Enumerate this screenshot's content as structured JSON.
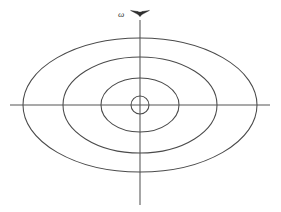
{
  "figure": {
    "background_color": "#ffffff",
    "line_color": "#4a4a4a",
    "axis_color": "#555555",
    "width": 281,
    "height": 212
  },
  "labels": {
    "omega": {
      "text": "ω",
      "name": "angular-velocity-symbol",
      "x": 118,
      "y": 10
    }
  },
  "markers": {
    "rotation_arrow": {
      "name": "rotation-axis-arrowhead",
      "description": "double arrowhead on vertical axis indicating angular velocity vector",
      "x": 140,
      "y": 13
    }
  },
  "chart_data": {
    "type": "line",
    "subtitle": "",
    "xlabel": "",
    "ylabel": "",
    "grid": false,
    "legend": "none",
    "center": {
      "x": 140,
      "y": 105
    },
    "axes": {
      "horizontal": {
        "x1": 10,
        "y1": 105,
        "x2": 270,
        "y2": 105
      },
      "vertical": {
        "x1": 140,
        "y1": 20,
        "x2": 140,
        "y2": 205
      }
    },
    "annotations": [
      {
        "text": "ω",
        "x": 118,
        "y": 10
      }
    ],
    "series": [
      {
        "name": "contour-1-inner",
        "shape": "ellipse",
        "cx": 140,
        "cy": 105,
        "rx": 9,
        "ry": 9,
        "x_intercepts": [
          131,
          149
        ],
        "y_intercepts": [
          96,
          114
        ]
      },
      {
        "name": "contour-2",
        "shape": "ellipse",
        "cx": 140,
        "cy": 105,
        "rx": 39,
        "ry": 27,
        "x_intercepts": [
          101,
          179
        ],
        "y_intercepts": [
          78,
          132
        ]
      },
      {
        "name": "contour-3",
        "shape": "ellipse",
        "cx": 140,
        "cy": 105,
        "rx": 77,
        "ry": 48,
        "x_intercepts": [
          63,
          217
        ],
        "y_intercepts": [
          57,
          153
        ]
      },
      {
        "name": "contour-4-outer",
        "shape": "ellipse",
        "cx": 140,
        "cy": 105,
        "rx": 117,
        "ry": 67,
        "x_intercepts": [
          23,
          257
        ],
        "y_intercepts": [
          38,
          172
        ]
      }
    ]
  }
}
